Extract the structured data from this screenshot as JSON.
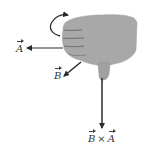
{
  "diagram": {
    "type": "right-hand-rule",
    "labels": {
      "vector_a": "A",
      "vector_b": "B",
      "cross_left": "B",
      "cross_op": "×",
      "cross_right": "A"
    },
    "colors": {
      "hand": "#a8a8a8",
      "hand_shadow": "#8c8c8c",
      "arrow": "#2a2a2a",
      "background": "#ffffff"
    }
  }
}
